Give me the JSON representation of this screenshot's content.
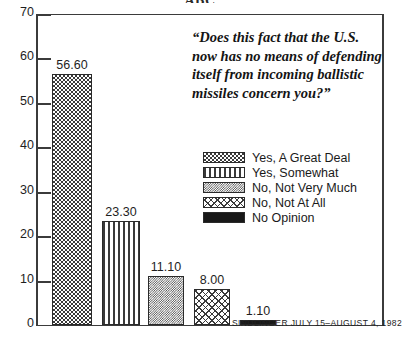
{
  "chart_data": {
    "type": "bar",
    "title": "ABC",
    "categories": [
      "Yes, A Great Deal",
      "Yes, Somewhat",
      "No, Not Very Much",
      "No, Not At All",
      "No Opinion"
    ],
    "values": [
      56.6,
      23.3,
      11.1,
      8.0,
      1.1
    ],
    "value_labels": [
      "56.60",
      "23.30",
      "11.10",
      "8.00",
      "1.10"
    ],
    "xlabel": "",
    "ylabel": "",
    "ylim": [
      0,
      70
    ],
    "yticks": [
      0,
      10,
      20,
      30,
      40,
      50,
      60,
      70
    ],
    "ytick_labels": [
      "0",
      "10",
      "20",
      "30",
      "40",
      "50",
      "60",
      "70"
    ],
    "grid": false,
    "legend_position": "right-middle",
    "patterns": [
      "checkerboard",
      "vertical-lines",
      "fine-checker",
      "diamond-mesh",
      "solid-black"
    ]
  },
  "question": {
    "text": "“Does this fact that the U.S. now has no means of defending itself from incoming ballistic missiles concern you?”"
  },
  "legend": {
    "items": [
      {
        "label": "Yes, A Great Deal"
      },
      {
        "label": "Yes, Somewhat"
      },
      {
        "label": "No, Not Very Much"
      },
      {
        "label": "No, Not At All"
      },
      {
        "label": "No Opinion"
      }
    ]
  },
  "source": {
    "text": "SINDLINGER   JULY 15–AUGUST 4, 1982"
  },
  "colors": {
    "ink": "#1a1a1a",
    "axis": "#3b3b3b",
    "fill_dark": "#3a3a3a",
    "solid": "#181818"
  }
}
